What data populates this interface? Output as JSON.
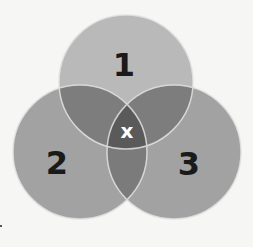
{
  "diagram": {
    "type": "venn",
    "sets": [
      {
        "id": "1",
        "label": "1",
        "cx": 126,
        "cy": 82,
        "r": 67,
        "fill": "#b9b9b9"
      },
      {
        "id": "2",
        "label": "2",
        "cx": 80,
        "cy": 152,
        "r": 67,
        "fill": "#a2a2a2"
      },
      {
        "id": "3",
        "label": "3",
        "cx": 174,
        "cy": 152,
        "r": 67,
        "fill": "#a2a2a2"
      }
    ],
    "intersection": {
      "label": "x",
      "color": "#ffffff"
    },
    "colors": {
      "background": "#f6f6f4",
      "outline": "#e2e2e2",
      "overlap_pair": "#7b7b7b",
      "overlap_all": "#5a5a5a",
      "label": "#1a1a1a"
    }
  }
}
